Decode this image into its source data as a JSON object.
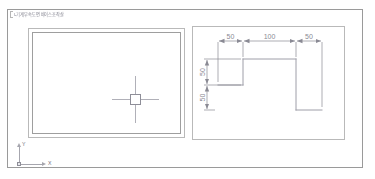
{
  "window": {
    "title_label": "l-기계부속도면 바이스조작살"
  },
  "left_viewport": {
    "name": "model-viewport",
    "cursor": {
      "icon": "crosshair-cursor-icon",
      "pickbox": "pickbox"
    }
  },
  "ucs": {
    "icon": "ucs-axis-icon",
    "y_label": "Y",
    "x_label": "X"
  },
  "right_viewport": {
    "name": "detail-viewport",
    "drawing": {
      "title": "Step profile with dimensions",
      "horizontal_dimensions": [
        {
          "label": "50",
          "value": 50
        },
        {
          "label": "100",
          "value": 100
        },
        {
          "label": "50",
          "value": 50
        }
      ],
      "vertical_dimensions": [
        {
          "label": "50",
          "value": 50
        },
        {
          "label": "50",
          "value": 50
        }
      ]
    }
  },
  "colors": {
    "frame": "#9a9a9a",
    "viewport_border": "#b9b9b9",
    "geometry": "#9e9ea8",
    "dimension": "#8a8a94",
    "cursor": "#b0b0b8"
  }
}
